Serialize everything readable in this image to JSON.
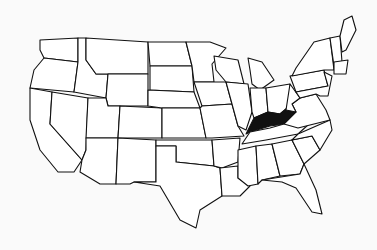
{
  "map": {
    "title": "United States",
    "highlighted_state": "Kentucky",
    "colors": {
      "background": "#fafafa",
      "fill": "#ffffff",
      "stroke": "#111111",
      "highlight": "#111111"
    },
    "states": [
      {
        "name": "Washington",
        "points": "40,40 78,38 78,62 44,58 40,50"
      },
      {
        "name": "Oregon",
        "points": "44,58 78,62 74,92 30,88 34,70"
      },
      {
        "name": "California",
        "points": "30,88 52,92 50,124 82,160 74,172 58,172 40,150 30,120"
      },
      {
        "name": "Nevada",
        "points": "52,92 88,98 86,150 82,160 50,124"
      },
      {
        "name": "Idaho",
        "points": "78,38 86,38 86,60 96,74 108,74 106,98 74,92 78,62"
      },
      {
        "name": "Montana",
        "points": "86,38 148,42 148,74 108,74 96,74 86,60"
      },
      {
        "name": "Wyoming",
        "points": "108,74 148,74 148,106 108,106 106,98"
      },
      {
        "name": "Utah",
        "points": "88,98 106,98 108,106 120,106 118,138 86,138"
      },
      {
        "name": "Colorado",
        "points": "120,106 162,108 162,138 118,138"
      },
      {
        "name": "Arizona",
        "points": "86,138 118,138 116,184 100,184 80,172 82,160 86,150"
      },
      {
        "name": "New Mexico",
        "points": "118,138 156,140 156,182 134,182 130,184 116,184"
      },
      {
        "name": "North Dakota",
        "points": "148,42 186,42 192,66 150,66"
      },
      {
        "name": "South Dakota",
        "points": "150,66 192,66 194,92 150,90"
      },
      {
        "name": "Nebraska",
        "points": "148,90 194,92 200,108 162,108 148,106"
      },
      {
        "name": "Kansas",
        "points": "162,108 200,108 206,138 162,138"
      },
      {
        "name": "Oklahoma",
        "points": "156,140 212,140 214,166 176,162 176,146 156,146"
      },
      {
        "name": "Texas",
        "points": "156,146 176,146 176,162 214,166 220,168 222,196 200,210 196,228 180,220 160,186 134,182 156,182"
      },
      {
        "name": "Minnesota",
        "points": "186,42 210,42 226,48 212,64 214,82 194,82 192,66"
      },
      {
        "name": "Iowa",
        "points": "194,82 226,82 232,104 202,106"
      },
      {
        "name": "Missouri",
        "points": "202,106 232,104 238,126 244,136 212,138 206,138 200,108"
      },
      {
        "name": "Arkansas",
        "points": "212,140 240,138 238,162 222,168 214,166"
      },
      {
        "name": "Louisiana",
        "points": "220,168 238,166 238,178 250,186 240,196 222,196"
      },
      {
        "name": "Wisconsin",
        "points": "214,56 238,60 244,84 226,82 216,70"
      },
      {
        "name": "Illinois",
        "points": "226,82 248,84 252,112 246,130 238,126 232,104"
      },
      {
        "name": "Michigan",
        "points": "248,58 262,62 274,80 260,90 252,84 250,70"
      },
      {
        "name": "Indiana",
        "points": "250,88 266,88 268,112 254,118 252,112"
      },
      {
        "name": "Ohio",
        "points": "266,88 290,84 292,104 280,114 268,112"
      },
      {
        "name": "Kentucky",
        "points": "246,134 254,118 268,112 280,114 292,104 296,112 284,124 270,126 250,132"
      },
      {
        "name": "Tennessee",
        "points": "242,144 250,132 270,128 284,124 320,114 298,134 266,140"
      },
      {
        "name": "Mississippi",
        "points": "238,150 256,146 258,184 248,186 238,178"
      },
      {
        "name": "Alabama",
        "points": "256,146 272,144 280,176 262,180 258,184"
      },
      {
        "name": "Georgia",
        "points": "272,144 292,140 304,164 300,174 280,176"
      },
      {
        "name": "Florida",
        "points": "262,180 300,174 304,164 316,190 322,214 312,212 296,188 282,182"
      },
      {
        "name": "South Carolina",
        "points": "292,140 312,136 320,150 304,164"
      },
      {
        "name": "North Carolina",
        "points": "298,134 330,120 332,130 320,150 312,136 292,140"
      },
      {
        "name": "Virginia",
        "points": "292,104 300,98 316,94 326,110 330,120 298,128 284,124 296,112"
      },
      {
        "name": "West Virginia",
        "points": "290,84 300,98 292,104 296,112 286,110"
      },
      {
        "name": "Pennsylvania",
        "points": "290,76 324,70 328,86 296,92"
      },
      {
        "name": "New York",
        "points": "296,68 314,42 330,38 334,70 324,70 292,76"
      },
      {
        "name": "Vermont/NH",
        "points": "330,38 340,36 342,62 334,66"
      },
      {
        "name": "Maine",
        "points": "340,36 344,20 352,16 356,30 346,50 342,52"
      },
      {
        "name": "Massachusetts/CT/RI",
        "points": "334,62 348,60 346,74 334,74"
      },
      {
        "name": "New Jersey/Delaware/Maryland",
        "points": "324,72 332,76 328,96 320,96 316,94 300,98 296,92 328,86"
      }
    ]
  }
}
